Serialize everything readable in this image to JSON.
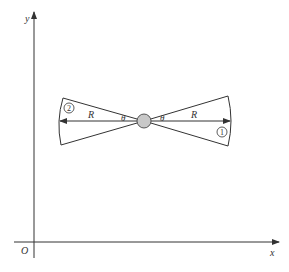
{
  "axes": {
    "x_label": "x",
    "y_label": "y",
    "origin_label": "O"
  },
  "sectors": {
    "left": {
      "region_label": "2",
      "radius_label": "R",
      "angle_label": "θ"
    },
    "right": {
      "region_label": "1",
      "radius_label": "R",
      "angle_label": "θ"
    }
  },
  "colors": {
    "line": "#333333",
    "pivot_fill": "#c8c8c8"
  }
}
